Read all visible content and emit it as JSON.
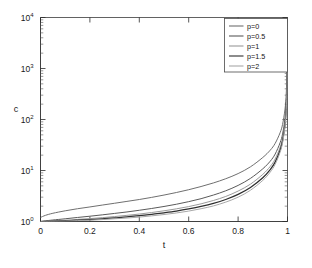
{
  "chart_data": {
    "type": "line",
    "title": "",
    "xlabel": "t",
    "ylabel": "c",
    "xlim": [
      0,
      1
    ],
    "ylim": [
      1,
      10000
    ],
    "yscale": "log",
    "xscale": "linear",
    "grid": false,
    "legend_position": "top-right",
    "xticks": [
      "0",
      "0.2",
      "0.4",
      "0.6",
      "0.8",
      "1"
    ],
    "xtick_values": [
      0,
      0.2,
      0.4,
      0.6,
      0.8,
      1
    ],
    "yticks": [
      "10",
      "10",
      "10",
      "10",
      "10"
    ],
    "ytick_exponents": [
      "0",
      "1",
      "2",
      "3",
      "4"
    ],
    "ytick_values": [
      1,
      10,
      100,
      1000,
      10000
    ],
    "series": [
      {
        "name": "p=0",
        "color": "#6f6f6f",
        "width": 1.0,
        "x": [
          0,
          0.02,
          0.05,
          0.1,
          0.15,
          0.2,
          0.25,
          0.3,
          0.35,
          0.4,
          0.45,
          0.5,
          0.55,
          0.6,
          0.65,
          0.7,
          0.75,
          0.8,
          0.85,
          0.9,
          0.93,
          0.95,
          0.97,
          0.98,
          0.99,
          0.995,
          0.998,
          1
        ],
        "y": [
          1.2,
          1.32,
          1.45,
          1.62,
          1.78,
          1.93,
          2.1,
          2.28,
          2.48,
          2.7,
          2.97,
          3.3,
          3.7,
          4.2,
          4.85,
          5.7,
          6.9,
          8.7,
          11.8,
          18.0,
          25.0,
          34.0,
          55.0,
          80.0,
          160.0,
          330.0,
          800.0,
          2500.0
        ]
      },
      {
        "name": "p=0.5",
        "color": "#5a5a5a",
        "width": 1.0,
        "x": [
          0,
          0.02,
          0.05,
          0.1,
          0.15,
          0.2,
          0.25,
          0.3,
          0.35,
          0.4,
          0.45,
          0.5,
          0.55,
          0.6,
          0.65,
          0.7,
          0.75,
          0.8,
          0.85,
          0.9,
          0.93,
          0.95,
          0.97,
          0.98,
          0.99,
          0.995,
          0.998,
          1
        ],
        "y": [
          1.0,
          1.03,
          1.07,
          1.13,
          1.2,
          1.27,
          1.35,
          1.44,
          1.54,
          1.66,
          1.8,
          1.97,
          2.18,
          2.45,
          2.8,
          3.3,
          4.0,
          5.1,
          7.0,
          10.8,
          15.2,
          21.0,
          35.0,
          52.0,
          105.0,
          220.0,
          550.0,
          1800.0
        ]
      },
      {
        "name": "p=1",
        "color": "#9a9a9a",
        "width": 1.0,
        "x": [
          0,
          0.02,
          0.05,
          0.1,
          0.15,
          0.2,
          0.25,
          0.3,
          0.35,
          0.4,
          0.45,
          0.5,
          0.55,
          0.6,
          0.65,
          0.7,
          0.75,
          0.8,
          0.85,
          0.9,
          0.93,
          0.95,
          0.97,
          0.98,
          0.99,
          0.995,
          0.998,
          1
        ],
        "y": [
          1.0,
          1.01,
          1.03,
          1.06,
          1.1,
          1.14,
          1.19,
          1.25,
          1.32,
          1.4,
          1.5,
          1.62,
          1.77,
          1.96,
          2.22,
          2.58,
          3.1,
          3.95,
          5.4,
          8.4,
          12.0,
          16.8,
          28.5,
          43.0,
          88.0,
          185.0,
          470.0,
          1500.0
        ]
      },
      {
        "name": "p=1.5",
        "color": "#2e2e2e",
        "width": 1.25,
        "x": [
          0,
          0.02,
          0.05,
          0.1,
          0.15,
          0.2,
          0.25,
          0.3,
          0.35,
          0.4,
          0.45,
          0.5,
          0.55,
          0.6,
          0.65,
          0.7,
          0.75,
          0.8,
          0.85,
          0.9,
          0.93,
          0.95,
          0.97,
          0.98,
          0.99,
          0.995,
          0.998,
          1
        ],
        "y": [
          1.0,
          1.005,
          1.015,
          1.035,
          1.06,
          1.09,
          1.13,
          1.18,
          1.23,
          1.3,
          1.38,
          1.48,
          1.6,
          1.76,
          1.97,
          2.26,
          2.7,
          3.4,
          4.65,
          7.2,
          10.4,
          14.6,
          25.0,
          38.0,
          79.0,
          168.0,
          430.0,
          1400.0
        ]
      },
      {
        "name": "p=2",
        "color": "#a8a8a8",
        "width": 1.0,
        "x": [
          0,
          0.02,
          0.05,
          0.1,
          0.15,
          0.2,
          0.25,
          0.3,
          0.35,
          0.4,
          0.45,
          0.5,
          0.55,
          0.6,
          0.65,
          0.7,
          0.75,
          0.8,
          0.85,
          0.9,
          0.93,
          0.95,
          0.97,
          0.98,
          0.99,
          0.995,
          0.998,
          1
        ],
        "y": [
          1.0,
          1.002,
          1.008,
          1.02,
          1.04,
          1.06,
          1.09,
          1.13,
          1.17,
          1.22,
          1.29,
          1.37,
          1.47,
          1.6,
          1.78,
          2.02,
          2.4,
          3.0,
          4.1,
          6.4,
          9.3,
          13.2,
          22.8,
          35.0,
          73.0,
          156.0,
          400.0,
          1300.0
        ]
      }
    ]
  },
  "legend": {
    "entries": [
      {
        "label": "p=0"
      },
      {
        "label": "p=0.5"
      },
      {
        "label": "p=1"
      },
      {
        "label": "p=1.5"
      },
      {
        "label": "p=2"
      }
    ]
  },
  "axes": {
    "x_label": "t",
    "y_label": "c",
    "y_base": "10"
  }
}
